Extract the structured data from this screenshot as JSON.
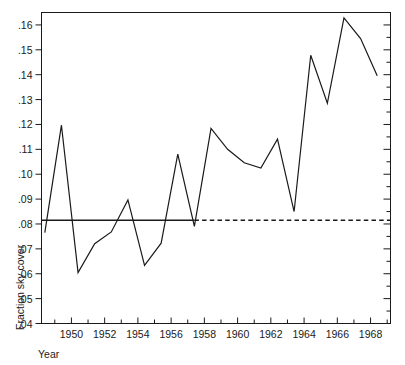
{
  "chart_data": {
    "type": "line",
    "title": "",
    "xlabel": "Year",
    "ylabel": "Fraction sky cover",
    "xlim": [
      1948.2,
      1969.2
    ],
    "ylim": [
      0.04,
      0.165
    ],
    "grid": false,
    "legend": null,
    "x_tick_labels": [
      "1950",
      "1952",
      "1954",
      "1956",
      "1958",
      "1960",
      "1962",
      "1964",
      "1966",
      "1968"
    ],
    "x_tick_values": [
      1950,
      1952,
      1954,
      1956,
      1958,
      1960,
      1962,
      1964,
      1966,
      1968
    ],
    "x_minor_tick_values": [
      1949,
      1951,
      1953,
      1955,
      1957,
      1959,
      1961,
      1963,
      1965,
      1967,
      1969
    ],
    "y_tick_labels": [
      ".16",
      ".15",
      ".14",
      ".13",
      ".12",
      ".11",
      ".10",
      ".09",
      ".08",
      ".07",
      ".06",
      ".05",
      ".04"
    ],
    "y_tick_values": [
      0.16,
      0.15,
      0.14,
      0.13,
      0.12,
      0.11,
      0.1,
      0.09,
      0.08,
      0.07,
      0.06,
      0.05,
      0.04
    ],
    "series": [
      {
        "name": "Fraction sky cover",
        "style": "solid",
        "color": "#1a1a1a",
        "x": [
          1948.4,
          1949.4,
          1950.4,
          1951.4,
          1952.4,
          1953.4,
          1954.4,
          1955.4,
          1956.4,
          1957.4,
          1958.4,
          1959.4,
          1960.4,
          1961.4,
          1962.4,
          1963.4,
          1964.4,
          1965.4,
          1966.4,
          1967.4,
          1968.4
        ],
        "y": [
          0.0765,
          0.1197,
          0.0605,
          0.0721,
          0.0768,
          0.0897,
          0.0634,
          0.0723,
          0.1081,
          0.079,
          0.1184,
          0.11,
          0.1046,
          0.1025,
          0.1141,
          0.085,
          0.1478,
          0.1285,
          0.1628,
          0.1545,
          0.1396
        ]
      }
    ],
    "reference_line": {
      "name": "mean-reference-line",
      "value": 0.0815,
      "solid_from_x": 1948.2,
      "solid_to_x": 1957.4,
      "dashed_from_x": 1957.4,
      "dashed_to_x": 1969.2,
      "color": "#1a1a1a"
    }
  },
  "axis": {
    "frame_color": "#1a1a1a",
    "background": "#ffffff"
  }
}
